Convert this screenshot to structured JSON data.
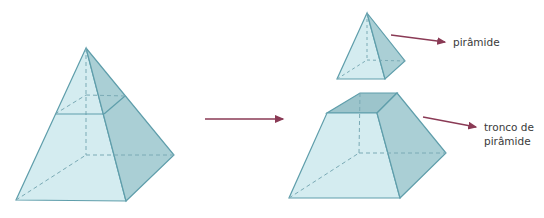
{
  "diagram": {
    "type": "geometry-pyramid-section",
    "colors": {
      "front_face": "#d4ecf0",
      "side_face": "#aacfd5",
      "top_face": "#9cc4cb",
      "edge": "#5f9eab",
      "arrow": "#8a3a55"
    },
    "labels": {
      "pyramid": "pirâmide",
      "frustum_line1": "tronco de",
      "frustum_line2": "pirâmide"
    }
  }
}
